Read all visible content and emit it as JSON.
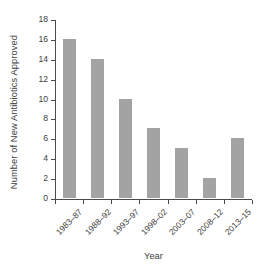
{
  "chart_data": {
    "type": "bar",
    "title": "",
    "xlabel": "Year",
    "ylabel": "Number of New Antibiotics Approved",
    "categories": [
      "1983–87",
      "1988–92",
      "1993–97",
      "1998–02",
      "2003–07",
      "2008–12",
      "2013–15"
    ],
    "values": [
      16,
      14,
      10,
      7,
      5,
      2,
      6
    ],
    "ylim": [
      0,
      18
    ],
    "ytick_labels": [
      "0",
      "2",
      "4",
      "6",
      "8",
      "10",
      "12",
      "14",
      "16",
      "18"
    ],
    "ytick_values": [
      0,
      2,
      4,
      6,
      8,
      10,
      12,
      14,
      16,
      18
    ],
    "grid": false,
    "legend": false,
    "bar_color": "#a3a3a3",
    "axis_color": "#4a4a4a",
    "background": "#ffffff"
  }
}
